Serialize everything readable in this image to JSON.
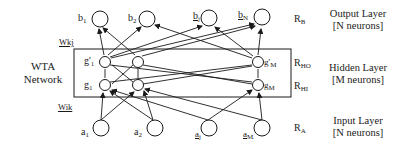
{
  "diagram": {
    "wta_label_line1": "WTA",
    "wta_label_line2": "Network",
    "weights": {
      "upper": "Wkj",
      "lower": "Wik"
    },
    "output_layer": {
      "nodes": [
        {
          "label": "b",
          "sub": "1"
        },
        {
          "label": "b",
          "sub": "2"
        },
        {
          "label": "b",
          "sub": "j"
        },
        {
          "label": "b",
          "sub": "N"
        }
      ],
      "region": "R",
      "region_sub": "B",
      "name": "Output Layer",
      "count": "[N neurons]"
    },
    "hidden_layer": {
      "output_nodes": [
        {
          "label": "g'",
          "sub": "1"
        },
        {
          "label": "g'",
          "sub": "M"
        }
      ],
      "input_nodes": [
        {
          "label": "g",
          "sub": "1"
        },
        {
          "label": "g",
          "sub": "M"
        }
      ],
      "region_out": "R",
      "region_out_sub": "HO",
      "region_in": "R",
      "region_in_sub": "HI",
      "name": "Hidden Layer",
      "count": "[M neurons]"
    },
    "input_layer": {
      "nodes": [
        {
          "label": "a",
          "sub": "1"
        },
        {
          "label": "a",
          "sub": "2"
        },
        {
          "label": "a",
          "sub": "j"
        },
        {
          "label": "a",
          "sub": "M"
        }
      ],
      "region": "R",
      "region_sub": "A",
      "name": "Input Layer",
      "count": "[N neurons]"
    },
    "colors": {
      "stroke": "#1a1a1a",
      "background": "#ffffff"
    }
  }
}
